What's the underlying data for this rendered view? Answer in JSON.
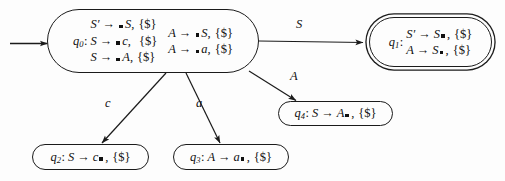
{
  "diagram": {
    "background_color": "#fdfdfd",
    "line_color": "#1b1b1b",
    "text_color": "#111111",
    "start_arrow": {
      "name": "start-arrow"
    }
  },
  "states": [
    {
      "id": "q0",
      "label": "q",
      "subscript": "0",
      "colon": ":",
      "accepting": false,
      "columns": [
        [
          {
            "lhs": "S",
            "prime": "′",
            "arrow": "→",
            "dot_before": "",
            "body": "S",
            "comma": ",",
            "lookahead": "{$}"
          },
          {
            "lhs": "S",
            "prime": "",
            "arrow": "→",
            "dot_before": "",
            "body": "c",
            "comma": ",",
            "lookahead": "{$}"
          },
          {
            "lhs": "S",
            "prime": "",
            "arrow": "→",
            "dot_before": "",
            "body": "A",
            "comma": ",",
            "lookahead": "{$}"
          }
        ],
        [
          {
            "lhs": "A",
            "prime": "",
            "arrow": "→",
            "dot_before": "",
            "body": "S",
            "comma": ",",
            "lookahead": "{$}"
          },
          {
            "lhs": "A",
            "prime": "",
            "arrow": "→",
            "dot_before": "",
            "body": "a",
            "comma": ",",
            "lookahead": "{$}"
          }
        ]
      ]
    },
    {
      "id": "q1",
      "label": "q",
      "subscript": "1",
      "colon": ":",
      "accepting": true,
      "columns": [
        [
          {
            "lhs": "S",
            "prime": "′",
            "arrow": "→",
            "pre": "S",
            "dot_after": true,
            "comma": ",",
            "lookahead": "{$}"
          },
          {
            "lhs": "A",
            "prime": "",
            "arrow": "→",
            "pre": "S",
            "dot_after": true,
            "comma": ",",
            "lookahead": "{$}"
          }
        ]
      ]
    },
    {
      "id": "q2",
      "label": "q",
      "subscript": "2",
      "colon": ":",
      "accepting": false,
      "columns": [
        [
          {
            "lhs": "S",
            "prime": "",
            "arrow": "→",
            "pre": "c",
            "dot_after": true,
            "comma": ",",
            "lookahead": "{$}"
          }
        ]
      ]
    },
    {
      "id": "q3",
      "label": "q",
      "subscript": "3",
      "colon": ":",
      "accepting": false,
      "columns": [
        [
          {
            "lhs": "A",
            "prime": "",
            "arrow": "→",
            "pre": "a",
            "dot_after": true,
            "comma": ",",
            "lookahead": "{$}"
          }
        ]
      ]
    },
    {
      "id": "q4",
      "label": "q",
      "subscript": "4",
      "colon": ":",
      "accepting": false,
      "columns": [
        [
          {
            "lhs": "S",
            "prime": "",
            "arrow": "→",
            "pre": "A",
            "dot_after": true,
            "comma": ",",
            "lookahead": "{$}"
          }
        ]
      ]
    }
  ],
  "transitions": [
    {
      "name": "transition-q0-q1",
      "from": "q0",
      "to": "q1",
      "symbol": "S"
    },
    {
      "name": "transition-q0-q4",
      "from": "q0",
      "to": "q4",
      "symbol": "A"
    },
    {
      "name": "transition-q0-q2",
      "from": "q0",
      "to": "q2",
      "symbol": "c"
    },
    {
      "name": "transition-q0-q3",
      "from": "q0",
      "to": "q3",
      "symbol": "a"
    }
  ]
}
